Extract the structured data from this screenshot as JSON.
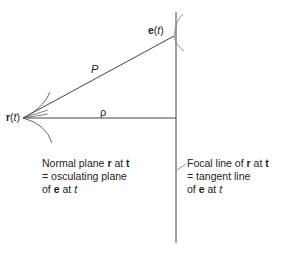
{
  "diagram": {
    "point_r": {
      "name": "r",
      "arg": "t"
    },
    "point_e": {
      "name": "e",
      "arg": "t"
    },
    "segment_P": "P",
    "segment_rho": "ρ",
    "left_caption": {
      "line1_a": "Normal plane ",
      "line1_b": "r",
      "line1_c": " at ",
      "line1_d": "t",
      "line2": "= osculating plane",
      "line3_a": "of ",
      "line3_b": "e",
      "line3_c": " at ",
      "line3_d": "t"
    },
    "right_caption": {
      "line1_a": "Focal line of ",
      "line1_b": "r",
      "line1_c": " at ",
      "line1_d": "t",
      "line2": "= tangent line",
      "line3_a": "of ",
      "line3_b": "e",
      "line3_c": " at ",
      "line3_d": "t"
    },
    "paren_open": "(",
    "paren_close": ")"
  }
}
